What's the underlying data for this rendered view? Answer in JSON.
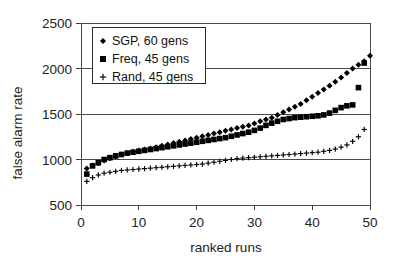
{
  "chart_data": {
    "type": "scatter",
    "title": "",
    "xlabel": "ranked runs",
    "ylabel": "false alarm rate",
    "xlim": [
      0,
      50
    ],
    "ylim": [
      500,
      2500
    ],
    "xticks": [
      0,
      10,
      20,
      30,
      40,
      50
    ],
    "yticks": [
      500,
      1000,
      1500,
      2000,
      2500
    ],
    "grid": true,
    "legend_position": "top-left-inside",
    "series": [
      {
        "name": "SGP, 60 gens",
        "marker": "diamond",
        "color": "#000000",
        "x": [
          1,
          2,
          3,
          4,
          5,
          6,
          7,
          8,
          9,
          10,
          11,
          12,
          13,
          14,
          15,
          16,
          17,
          18,
          19,
          20,
          21,
          22,
          23,
          24,
          25,
          26,
          27,
          28,
          29,
          30,
          31,
          32,
          33,
          34,
          35,
          36,
          37,
          38,
          39,
          40,
          41,
          42,
          43,
          44,
          45,
          46,
          47,
          48,
          49,
          50
        ],
        "values": [
          900,
          935,
          960,
          990,
          1015,
          1035,
          1055,
          1070,
          1085,
          1100,
          1110,
          1120,
          1135,
          1150,
          1165,
          1180,
          1195,
          1210,
          1225,
          1240,
          1255,
          1270,
          1285,
          1300,
          1315,
          1330,
          1345,
          1360,
          1375,
          1395,
          1420,
          1440,
          1460,
          1490,
          1520,
          1550,
          1580,
          1610,
          1650,
          1690,
          1730,
          1770,
          1810,
          1855,
          1900,
          1950,
          2000,
          2040,
          2080,
          2140
        ]
      },
      {
        "name": "Freq, 45 gens",
        "marker": "square",
        "color": "#000000",
        "x": [
          1,
          2,
          3,
          4,
          5,
          6,
          7,
          8,
          9,
          10,
          11,
          12,
          13,
          14,
          15,
          16,
          17,
          18,
          19,
          20,
          21,
          22,
          23,
          24,
          25,
          26,
          27,
          28,
          29,
          30,
          31,
          32,
          33,
          34,
          35,
          36,
          37,
          38,
          39,
          40,
          41,
          42,
          43,
          44,
          45,
          46,
          47,
          48,
          49
        ],
        "values": [
          840,
          930,
          965,
          1000,
          1020,
          1040,
          1055,
          1070,
          1080,
          1090,
          1100,
          1110,
          1120,
          1130,
          1140,
          1150,
          1160,
          1170,
          1180,
          1190,
          1200,
          1210,
          1220,
          1230,
          1240,
          1255,
          1270,
          1285,
          1300,
          1320,
          1345,
          1375,
          1400,
          1420,
          1440,
          1450,
          1460,
          1465,
          1470,
          1475,
          1480,
          1490,
          1510,
          1540,
          1570,
          1590,
          1600,
          1790,
          2060
        ]
      },
      {
        "name": "Rand, 45 gens",
        "marker": "plus",
        "color": "#000000",
        "x": [
          1,
          2,
          3,
          4,
          5,
          6,
          7,
          8,
          9,
          10,
          11,
          12,
          13,
          14,
          15,
          16,
          17,
          18,
          19,
          20,
          21,
          22,
          23,
          24,
          25,
          26,
          27,
          28,
          29,
          30,
          31,
          32,
          33,
          34,
          35,
          36,
          37,
          38,
          39,
          40,
          41,
          42,
          43,
          44,
          45,
          46,
          47,
          48,
          49
        ],
        "values": [
          760,
          800,
          830,
          850,
          860,
          870,
          880,
          885,
          890,
          895,
          900,
          905,
          910,
          915,
          920,
          925,
          930,
          935,
          940,
          945,
          950,
          960,
          970,
          980,
          990,
          1000,
          1010,
          1015,
          1020,
          1025,
          1030,
          1035,
          1040,
          1045,
          1050,
          1055,
          1060,
          1065,
          1070,
          1075,
          1080,
          1090,
          1100,
          1115,
          1135,
          1160,
          1200,
          1250,
          1330
        ]
      }
    ]
  },
  "axes": {
    "y_title": "false alarm rate",
    "x_title": "ranked runs",
    "y_tick_labels": [
      "2500",
      "2000",
      "1500",
      "1000",
      "500"
    ],
    "x_tick_labels": [
      "0",
      "10",
      "20",
      "30",
      "40",
      "50"
    ]
  },
  "legend": {
    "entries": [
      {
        "label": "SGP, 60 gens",
        "marker": "diamond-marker-icon"
      },
      {
        "label": "Freq, 45 gens",
        "marker": "square-marker-icon"
      },
      {
        "label": "Rand, 45 gens",
        "marker": "plus-marker-icon"
      }
    ]
  },
  "colors": {
    "marker": "#000000",
    "gridline": "#4a4a4a",
    "frame": "#4a4a4a",
    "background": "#ffffff",
    "text": "#222222"
  }
}
